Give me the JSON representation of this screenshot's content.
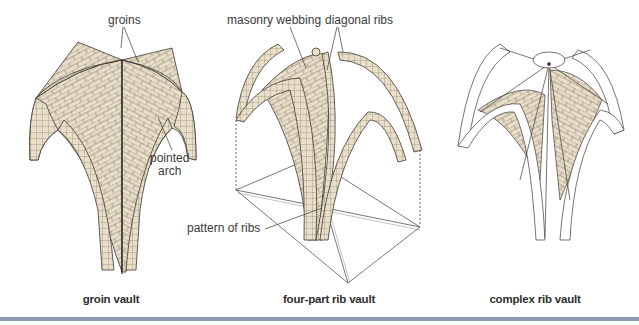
{
  "figures": [
    {
      "id": "groin-vault",
      "caption": "groin vault",
      "labels": {
        "groins": "groins",
        "pointed_arch_line1": "pointed",
        "pointed_arch_line2": "arch"
      }
    },
    {
      "id": "four-part-rib-vault",
      "caption": "four-part rib vault",
      "labels": {
        "masonry_webbing": "masonry webbing",
        "diagonal_ribs": "diagonal ribs",
        "pattern_of_ribs": "pattern of ribs"
      }
    },
    {
      "id": "complex-rib-vault",
      "caption": "complex rib vault",
      "labels": {}
    }
  ],
  "colors": {
    "masonry": "#e9dfc9",
    "mortar": "#6b6357",
    "outline": "#3d3a36",
    "rule": "#8c9bb0",
    "background": "#ffffff"
  }
}
